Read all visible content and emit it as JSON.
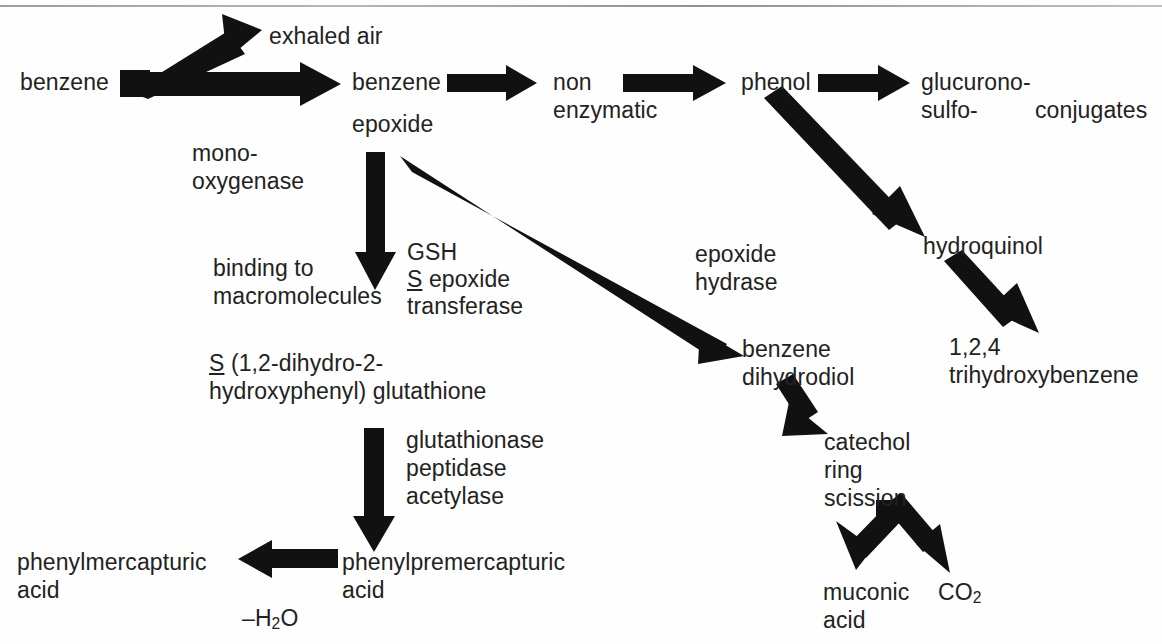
{
  "diagram": {
    "background_color": "#fefefe",
    "ink_color": "#111111",
    "text_color": "#222222"
  },
  "nodes": {
    "benzene_start": "benzene",
    "exhaled_air": "exhaled air",
    "benzene_epoxide_line1": "benzene",
    "benzene_epoxide_line2": "epoxide",
    "non_enzymatic_line1": "non",
    "non_enzymatic_line2": "enzymatic",
    "phenol": "phenol",
    "glucurono_line1": "glucurono-",
    "glucurono_line2": "sulfo-",
    "conjugates": "conjugates",
    "hydroquinol": "hydroquinol",
    "trihydroxybenzene_line1": "1,2,4",
    "trihydroxybenzene_line2": "trihydroxybenzene",
    "binding_line1": "binding to",
    "binding_line2": "macromolecules",
    "benzene_dihydrodiol_line1": "benzene",
    "benzene_dihydrodiol_line2": "dihydrodiol",
    "catechol_line1": "catechol",
    "catechol_line2": "ring",
    "catechol_line3": "scission",
    "muconic_acid_line1": "muconic",
    "muconic_acid_line2": "acid",
    "carbon_dioxide_prefix": "CO",
    "carbon_dioxide_subscript": "2",
    "glutathione_conj_line1_s": "S",
    "glutathione_conj_line1_rest": " (1,2-dihydro-2-",
    "glutathione_conj_line2": "hydroxyphenyl) glutathione",
    "phenylpremercapturic_line1": "phenylpremercapturic",
    "phenylpremercapturic_line2": "acid",
    "phenylmercapturic_line1": "phenylmercapturic",
    "phenylmercapturic_line2": "acid"
  },
  "enzyme_labels": {
    "monooxygenase_line1": "mono-",
    "monooxygenase_line2": "oxygenase",
    "gsh_line1": "GSH",
    "gsh_line2_s": "S",
    "gsh_line2_rest": " epoxide",
    "gsh_line3": "transferase",
    "epoxide_hydrase_line1": "epoxide",
    "epoxide_hydrase_line2": "hydrase",
    "glutathionase_line1": "glutathionase",
    "glutathionase_line2": "peptidase",
    "glutathionase_line3": "acetylase",
    "water_loss_prefix": "–H",
    "water_loss_subscript": "2",
    "water_loss_suffix": "O"
  },
  "edges": [
    {
      "id": "benzene-to-exhaled-air",
      "from": "benzene_start",
      "to": "exhaled_air",
      "style": "thick-diagonal-up"
    },
    {
      "id": "benzene-to-benzene-epoxide",
      "from": "benzene_start",
      "to": "benzene_epoxide",
      "style": "thick-horizontal",
      "label": "monooxygenase"
    },
    {
      "id": "benzene-epoxide-to-non-enzymatic",
      "from": "benzene_epoxide",
      "to": "non_enzymatic",
      "style": "horizontal"
    },
    {
      "id": "non-enzymatic-to-phenol",
      "from": "non_enzymatic",
      "to": "phenol",
      "style": "horizontal"
    },
    {
      "id": "phenol-to-glucurono-sulfo",
      "from": "phenol",
      "to": "glucurono_sulfo",
      "style": "horizontal"
    },
    {
      "id": "phenol-to-hydroquinol",
      "from": "phenol",
      "to": "hydroquinol",
      "style": "diagonal-down"
    },
    {
      "id": "hydroquinol-to-trihydroxybenzene",
      "from": "hydroquinol",
      "to": "trihydroxybenzene",
      "style": "diagonal-down"
    },
    {
      "id": "benzene-epoxide-to-binding",
      "from": "benzene_epoxide",
      "to": "binding_macromolecules",
      "style": "vertical-down"
    },
    {
      "id": "benzene-epoxide-to-benzene-dihydrodiol",
      "from": "benzene_epoxide",
      "to": "benzene_dihydrodiol",
      "style": "long-diagonal-down",
      "label": "epoxide hydrase"
    },
    {
      "id": "benzene-dihydrodiol-to-catechol",
      "from": "benzene_dihydrodiol",
      "to": "catechol",
      "style": "short-diagonal-down"
    },
    {
      "id": "catechol-to-muconic-acid",
      "from": "catechol",
      "to": "muconic_acid",
      "style": "fork-down-left"
    },
    {
      "id": "catechol-to-co2",
      "from": "catechol",
      "to": "carbon_dioxide",
      "style": "fork-down-right"
    },
    {
      "id": "glutathione-conjugate-to-phenylpremercapturic",
      "from": "glutathione_conjugate",
      "to": "phenylpremercapturic_acid",
      "style": "vertical-down",
      "label": "glutathionase peptidase acetylase"
    },
    {
      "id": "phenylpremercapturic-to-phenylmercapturic",
      "from": "phenylpremercapturic_acid",
      "to": "phenylmercapturic_acid",
      "style": "horizontal-left",
      "label": "-H2O"
    }
  ]
}
